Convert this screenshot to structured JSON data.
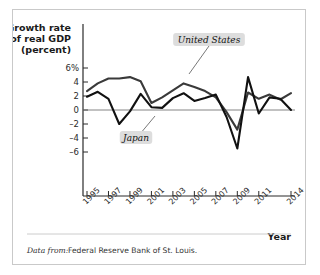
{
  "figure": {
    "source_prefix": "Data from:",
    "source_text": "Federal Reserve Bank of St. Louis.",
    "frame_color": "#c9c9c9",
    "background": "#ffffff"
  },
  "chart_data": {
    "type": "line",
    "title": "",
    "ylabel": "Growth rate of real GDP (percent)",
    "ylabel_line1": "Growth rate",
    "ylabel_line2": "of real GDP",
    "ylabel_line3": "(percent)",
    "xlabel": "Year",
    "grid": false,
    "legend_position": "inline-callout",
    "ylim": [
      -7,
      7
    ],
    "yticks": [
      6,
      4,
      2,
      0,
      -2,
      -4,
      -6
    ],
    "ytick_labels": [
      "6%",
      "4",
      "2",
      "0",
      "–2",
      "–4",
      "–6"
    ],
    "xlim": [
      1995,
      2014
    ],
    "xticks": [
      1995,
      1997,
      1999,
      2001,
      2003,
      2005,
      2007,
      2009,
      2011,
      2014
    ],
    "xtick_labels": [
      "1995",
      "1997",
      "1999",
      "2001",
      "2003",
      "2005",
      "2007",
      "2009",
      "2011",
      "2014"
    ],
    "x": [
      1995,
      1996,
      1997,
      1998,
      1999,
      2000,
      2001,
      2002,
      2003,
      2004,
      2005,
      2006,
      2007,
      2008,
      2009,
      2010,
      2011,
      2012,
      2013,
      2014
    ],
    "series": [
      {
        "name": "United States",
        "color": "#3a3a3a",
        "values": [
          2.7,
          3.8,
          4.5,
          4.5,
          4.7,
          4.1,
          1.0,
          1.8,
          2.8,
          3.8,
          3.3,
          2.7,
          1.8,
          -0.3,
          -2.8,
          2.5,
          1.6,
          2.2,
          1.5,
          2.4
        ]
      },
      {
        "name": "Japan",
        "color": "#111111",
        "values": [
          1.9,
          2.6,
          1.6,
          -2.0,
          -0.2,
          2.3,
          0.4,
          0.3,
          1.7,
          2.4,
          1.3,
          1.7,
          2.2,
          -1.0,
          -5.5,
          4.7,
          -0.5,
          1.8,
          1.6,
          0.0
        ]
      }
    ],
    "annotations": [
      {
        "label": "United States",
        "series": "United States"
      },
      {
        "label": "Japan",
        "series": "Japan"
      }
    ]
  }
}
